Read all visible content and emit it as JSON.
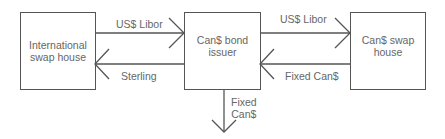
{
  "diagram": {
    "nodes": [
      {
        "id": "intl",
        "label_line1": "International",
        "label_line2": "swap house"
      },
      {
        "id": "issuer",
        "label_line1": "Can$ bond",
        "label_line2": "issuer"
      },
      {
        "id": "canswap",
        "label_line1": "Can$ swap",
        "label_line2": "house"
      }
    ],
    "edges": [
      {
        "from": "intl",
        "to": "issuer",
        "label": "US$ Libor"
      },
      {
        "from": "issuer",
        "to": "intl",
        "label": "Sterling"
      },
      {
        "from": "issuer",
        "to": "canswap",
        "label": "US$ Libor"
      },
      {
        "from": "canswap",
        "to": "issuer",
        "label": "Fixed Can$"
      },
      {
        "from": "issuer",
        "to": "out",
        "label_line1": "Fixed",
        "label_line2": "Can$"
      }
    ],
    "colors": {
      "line": "#555555",
      "text": "#666666"
    }
  }
}
